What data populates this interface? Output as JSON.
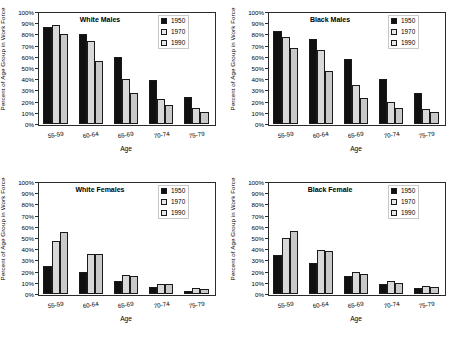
{
  "figure": {
    "shared_ylabel": "Percent of Age Group in Work Force",
    "shared_xlabel": "Age",
    "categories": [
      "55-59",
      "60-64",
      "65-69",
      "70-74",
      "75-79"
    ],
    "yticks": [
      "0%",
      "10%",
      "20%",
      "30%",
      "40%",
      "50%",
      "60%",
      "70%",
      "80%",
      "90%",
      "100%"
    ],
    "legend_labels": [
      "1950",
      "1970",
      "1990"
    ],
    "colors": {
      "series_1950": "#101010",
      "series_1970": "#d9d9d9",
      "series_1990": "#c9c9c9",
      "frame": "#2b2b2b"
    }
  },
  "panels": [
    {
      "title": "White Males"
    },
    {
      "title": "Black Males"
    },
    {
      "title": "White Females"
    },
    {
      "title": "Black Female"
    }
  ],
  "chart_data": [
    {
      "type": "bar",
      "title": "White Males",
      "xlabel": "Age",
      "ylabel": "Percent of Age Group in Work Force",
      "categories": [
        "55-59",
        "60-64",
        "65-69",
        "70-74",
        "75-79"
      ],
      "ylim": [
        0,
        100
      ],
      "grid": false,
      "legend_position": "top-right",
      "series": [
        {
          "name": "1950",
          "values": [
            87,
            80,
            60,
            39,
            24
          ]
        },
        {
          "name": "1970",
          "values": [
            88,
            74,
            40,
            22.5,
            14
          ]
        },
        {
          "name": "1990",
          "values": [
            80,
            56,
            28,
            17,
            11
          ]
        }
      ]
    },
    {
      "type": "bar",
      "title": "Black Males",
      "xlabel": "Age",
      "ylabel": "Percent of Age Group in Work Force",
      "categories": [
        "55-59",
        "60-64",
        "65-69",
        "70-74",
        "75-79"
      ],
      "ylim": [
        0,
        100
      ],
      "grid": false,
      "legend_position": "top-right",
      "series": [
        {
          "name": "1950",
          "values": [
            83,
            76,
            58,
            40,
            28
          ]
        },
        {
          "name": "1970",
          "values": [
            78,
            66,
            35,
            19.5,
            13.5
          ]
        },
        {
          "name": "1990",
          "values": [
            68,
            47.5,
            23,
            14,
            11
          ]
        }
      ]
    },
    {
      "type": "bar",
      "title": "White Females",
      "xlabel": "Age",
      "ylabel": "Percent of Age Group in Work Force",
      "categories": [
        "55-59",
        "60-64",
        "65-69",
        "70-74",
        "75-79"
      ],
      "ylim": [
        0,
        100
      ],
      "grid": false,
      "legend_position": "top-right",
      "series": [
        {
          "name": "1950",
          "values": [
            25,
            20,
            12,
            6,
            3
          ]
        },
        {
          "name": "1970",
          "values": [
            47,
            36,
            17,
            9,
            5
          ]
        },
        {
          "name": "1990",
          "values": [
            55.5,
            36,
            16.5,
            8.5,
            4.5
          ]
        }
      ]
    },
    {
      "type": "bar",
      "title": "Black Female",
      "xlabel": "Age",
      "ylabel": "Percent of Age Group in Work Force",
      "categories": [
        "55-59",
        "60-64",
        "65-69",
        "70-74",
        "75-79"
      ],
      "ylim": [
        0,
        100
      ],
      "grid": false,
      "legend_position": "top-right",
      "series": [
        {
          "name": "1950",
          "values": [
            35,
            27.5,
            16,
            8.5,
            5
          ]
        },
        {
          "name": "1970",
          "values": [
            50,
            39,
            19.5,
            12,
            7.5
          ]
        },
        {
          "name": "1990",
          "values": [
            56,
            38,
            18,
            10,
            6.5
          ]
        }
      ]
    }
  ]
}
